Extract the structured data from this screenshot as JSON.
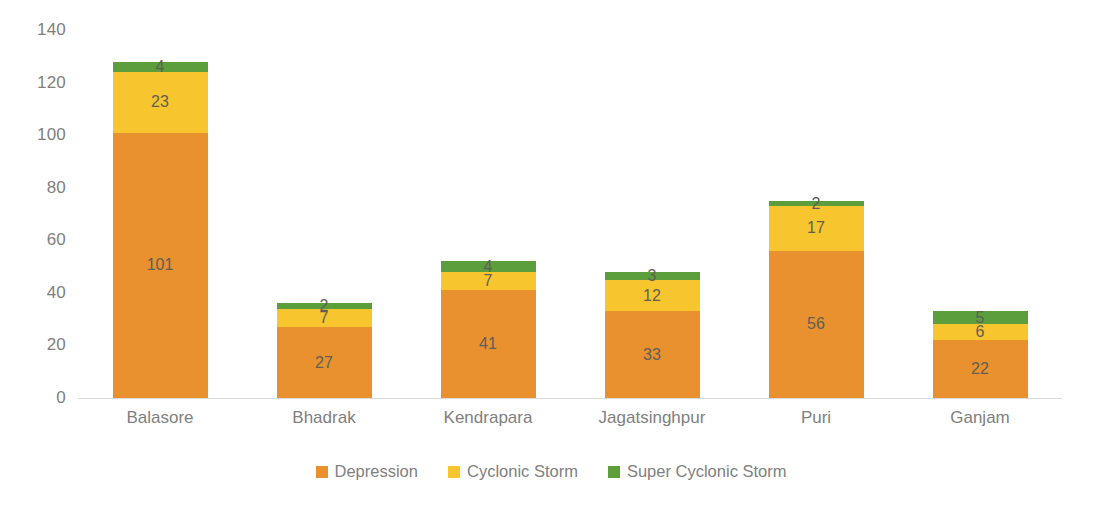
{
  "chart_data": {
    "type": "bar",
    "subtype": "stacked-bar",
    "title": "",
    "xlabel": "",
    "ylabel": "",
    "ylim": [
      0,
      140
    ],
    "y_ticks": [
      0,
      20,
      40,
      60,
      80,
      100,
      120,
      140
    ],
    "grid": false,
    "legend_position": "bottom",
    "categories": [
      "Balasore",
      "Bhadrak",
      "Kendrapara",
      "Jagatsinghpur",
      "Puri",
      "Ganjam"
    ],
    "series": [
      {
        "name": "Depression",
        "color": "#E8912E",
        "values": [
          101,
          27,
          41,
          33,
          56,
          22
        ]
      },
      {
        "name": "Cyclonic Storm",
        "color": "#F7C52D",
        "values": [
          23,
          7,
          7,
          12,
          17,
          6
        ]
      },
      {
        "name": "Super Cyclonic Storm",
        "color": "#5B9E3B",
        "values": [
          4,
          2,
          4,
          3,
          2,
          5
        ]
      }
    ],
    "totals": [
      128,
      36,
      52,
      48,
      75,
      33
    ],
    "data_labels": true,
    "colors": {
      "depression": "#E8912E",
      "cyclonic_storm": "#F7C52D",
      "super_cyclonic_storm": "#5B9E3B",
      "axis_text": "#808080",
      "data_label_text": "#5f5f57",
      "axis_line": "#d9d9d9",
      "background": "#ffffff"
    }
  }
}
